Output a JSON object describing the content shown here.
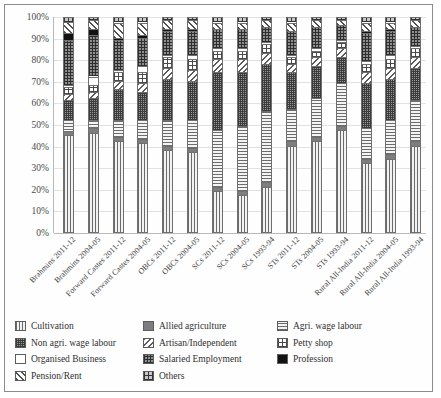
{
  "chart_data": {
    "type": "bar",
    "stacked": true,
    "normalized": "100%",
    "title": "",
    "subtitle": "",
    "xlabel": "",
    "ylabel": "",
    "ylim": [
      0,
      100
    ],
    "grid": true,
    "legend_position": "bottom",
    "ytick_labels": [
      "100%",
      "90%",
      "80%",
      "70%",
      "60%",
      "50%",
      "40%",
      "30%",
      "20%",
      "10%",
      "0%"
    ],
    "ytick_values": [
      100,
      90,
      80,
      70,
      60,
      50,
      40,
      30,
      20,
      10,
      0
    ],
    "categories": [
      "Brahmins 2011-12",
      "Brahmins 2004-05",
      "Forward Castes 2011-12",
      "Forward Castes 2004-05",
      "OBCs 2011-12",
      "OBCs 2004-05",
      "SCs 2011-12",
      "SCs 2004-05",
      "SCs 1993-94",
      "STs 2011-12",
      "STs 2004-05",
      "STs 1993-94",
      "Rural All-India 2011-12",
      "Rural All-India 2004-05",
      "Rural All-India 1993-94"
    ],
    "series": [
      {
        "name": "Cultivation",
        "pattern": "vertical-lines",
        "values": [
          45,
          46,
          42,
          41,
          38,
          37,
          19,
          17,
          21,
          40,
          42,
          47,
          32,
          34,
          40
        ]
      },
      {
        "name": "Allied agriculture",
        "pattern": "solid-gray",
        "values": [
          2,
          2,
          2,
          2,
          2,
          2,
          2,
          2,
          2,
          2,
          2,
          2,
          2,
          2,
          2
        ]
      },
      {
        "name": "Agri. wage labour",
        "pattern": "horizontal-lines",
        "values": [
          5,
          4,
          8,
          9,
          12,
          13,
          26,
          30,
          33,
          15,
          18,
          20,
          14,
          16,
          19
        ]
      },
      {
        "name": "Non agri. wage labour",
        "pattern": "fine-grid",
        "values": [
          9,
          10,
          14,
          13,
          19,
          18,
          27,
          25,
          22,
          17,
          15,
          12,
          21,
          19,
          15
        ]
      },
      {
        "name": "Artisan/Independent",
        "pattern": "diagonal-hatch",
        "values": [
          3,
          3,
          4,
          4,
          5,
          5,
          6,
          6,
          5,
          4,
          4,
          4,
          5,
          5,
          5
        ]
      },
      {
        "name": "Petty shop",
        "pattern": "coarse-grid",
        "values": [
          3,
          3,
          4,
          5,
          5,
          5,
          4,
          4,
          4,
          3,
          3,
          3,
          4,
          4,
          4
        ]
      },
      {
        "name": "Organised Business",
        "pattern": "white",
        "values": [
          1,
          4,
          1,
          3,
          1,
          2,
          1,
          1,
          1,
          1,
          1,
          1,
          1,
          2,
          1
        ]
      },
      {
        "name": "Salaried Employment",
        "pattern": "dense-grid",
        "values": [
          21,
          19,
          14,
          13,
          11,
          11,
          9,
          9,
          7,
          11,
          10,
          7,
          13,
          11,
          9
        ]
      },
      {
        "name": "Profession",
        "pattern": "solid-black",
        "values": [
          3,
          3,
          1,
          1,
          1,
          1,
          0,
          0,
          0,
          0,
          0,
          0,
          1,
          1,
          0
        ]
      },
      {
        "name": "Pension/Rent",
        "pattern": "diagonal-lines",
        "values": [
          5,
          4,
          7,
          6,
          4,
          4,
          3,
          3,
          3,
          4,
          3,
          2,
          4,
          3,
          3
        ]
      },
      {
        "name": "Others",
        "pattern": "checkered",
        "values": [
          3,
          2,
          3,
          3,
          2,
          2,
          3,
          3,
          2,
          3,
          2,
          2,
          3,
          3,
          2
        ]
      }
    ]
  },
  "legend": {
    "items": [
      {
        "label": "Cultivation",
        "pattern_class": "p-cultivation"
      },
      {
        "label": "Allied agriculture",
        "pattern_class": "p-allied"
      },
      {
        "label": "Agri. wage labour",
        "pattern_class": "p-agriwage"
      },
      {
        "label": "Non agri. wage labour",
        "pattern_class": "p-nonagri"
      },
      {
        "label": "Artisan/Independent",
        "pattern_class": "p-artisan"
      },
      {
        "label": "Petty shop",
        "pattern_class": "p-petty"
      },
      {
        "label": "Organised Business",
        "pattern_class": "p-business"
      },
      {
        "label": "Salaried Employment",
        "pattern_class": "p-salaried"
      },
      {
        "label": "Profession",
        "pattern_class": "p-profession"
      },
      {
        "label": "Pension/Rent",
        "pattern_class": "p-pension"
      },
      {
        "label": "Others",
        "pattern_class": "p-others"
      }
    ]
  },
  "colors": {
    "frame_border": "#8c8c8c",
    "gridline": "#e2e2e2",
    "axis": "#b9b9b9",
    "text": "#3a3a3a",
    "background": "#ffffff"
  }
}
